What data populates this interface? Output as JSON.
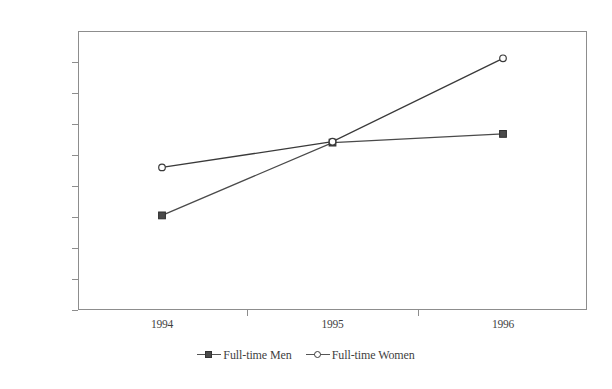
{
  "chart_data": {
    "type": "line",
    "title": "",
    "xlabel": "",
    "ylabel": "",
    "categories": [
      "1994",
      "1995",
      "1996"
    ],
    "ylim": [
      500000,
      590000
    ],
    "ytick_step": 10000,
    "yticks": [
      590000,
      580000,
      570000,
      560000,
      550000,
      540000,
      530000,
      520000,
      510000,
      500000
    ],
    "ytick_labels": [
      "590000",
      "580000",
      "570000",
      "560000",
      "550000",
      "540000",
      "530000",
      "520000",
      "510000",
      "500000"
    ],
    "grid": false,
    "legend_position": "bottom",
    "series": [
      {
        "name": "Full-time Men",
        "marker": "square",
        "color": "#4a4a4a",
        "values": [
          530500,
          554000,
          556800
        ]
      },
      {
        "name": "Full-time Women",
        "marker": "circle",
        "color": "#3a3a3a",
        "values": [
          546000,
          554300,
          581200
        ]
      }
    ]
  },
  "axes": {
    "frame_color": "#8d8d8d"
  },
  "legend": {
    "items": [
      {
        "label": "Full-time Men",
        "marker": "square-marker-icon"
      },
      {
        "label": "Full-time Women",
        "marker": "circle-marker-icon"
      }
    ]
  }
}
